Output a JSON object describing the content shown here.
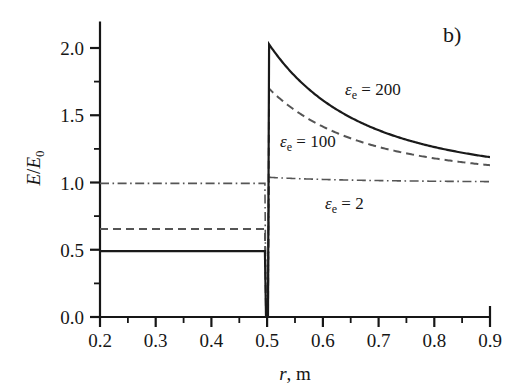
{
  "figure": {
    "panel_label": "b)",
    "background": "#ffffff",
    "ink_color": "#161616"
  },
  "axes": {
    "x": {
      "title_var": "r",
      "title_sep": ", ",
      "title_unit": "m",
      "min": 0.2,
      "max": 0.9,
      "major_ticks": [
        0.2,
        0.3,
        0.4,
        0.5,
        0.6,
        0.7,
        0.8,
        0.9
      ],
      "tick_labels": [
        "0.2",
        "0.3",
        "0.4",
        "0.5",
        "0.6",
        "0.7",
        "0.8",
        "0.9"
      ],
      "minor_ticks": [
        0.25,
        0.35,
        0.45,
        0.55,
        0.65,
        0.75,
        0.85
      ],
      "tick_direction": "out"
    },
    "y": {
      "title_num": "E",
      "title_slash": "/",
      "title_den": "E",
      "title_den_sub": "0",
      "min": 0.0,
      "max": 2.2,
      "major_ticks": [
        0.0,
        0.5,
        1.0,
        1.5,
        2.0
      ],
      "tick_labels": [
        "0.0",
        "0.5",
        "1.0",
        "1.5",
        "2.0"
      ],
      "minor_ticks": [
        0.25,
        0.75,
        1.25,
        1.75
      ],
      "tick_direction": "out"
    }
  },
  "chart_data": {
    "type": "line",
    "title": "",
    "subtitle": "",
    "xlabel": "r, m",
    "ylabel": "E/E0",
    "xlim": [
      0.2,
      0.9
    ],
    "ylim": [
      0.0,
      2.2
    ],
    "grid": false,
    "legend": "inline-annotations",
    "interface_radius": 0.5,
    "series": [
      {
        "name": "eps_e = 200",
        "label_eps": "ε",
        "label_sub": "e",
        "label_eq": " = ",
        "label_value": "200",
        "style": "solid",
        "color": "#1a1a1a",
        "width": 2.0,
        "inner_value": 0.49,
        "peak_value": 2.03,
        "end_value": 1.19,
        "x": [
          0.2,
          0.25,
          0.3,
          0.35,
          0.4,
          0.45,
          0.49,
          0.499,
          0.501,
          0.52,
          0.55,
          0.58,
          0.6,
          0.64,
          0.68,
          0.7,
          0.74,
          0.78,
          0.8,
          0.84,
          0.88,
          0.9
        ],
        "y": [
          0.49,
          0.49,
          0.49,
          0.49,
          0.49,
          0.49,
          0.49,
          0.49,
          2.03,
          1.905,
          1.745,
          1.61,
          1.532,
          1.4,
          1.3,
          1.258,
          1.19,
          1.142,
          1.122,
          1.09,
          1.064,
          1.19
        ]
      },
      {
        "name": "eps_e = 100",
        "label_eps": "ε",
        "label_sub": "e",
        "label_eq": " = ",
        "label_value": "100",
        "style": "dashed",
        "color": "#555555",
        "width": 2.0,
        "inner_value": 0.655,
        "peak_value": 1.7,
        "end_value": 1.13,
        "x": [
          0.2,
          0.25,
          0.3,
          0.35,
          0.4,
          0.45,
          0.49,
          0.499,
          0.501,
          0.52,
          0.55,
          0.58,
          0.6,
          0.64,
          0.68,
          0.7,
          0.74,
          0.78,
          0.8,
          0.84,
          0.88,
          0.9
        ],
        "y": [
          0.655,
          0.655,
          0.655,
          0.655,
          0.655,
          0.655,
          0.655,
          0.655,
          1.7,
          1.616,
          1.505,
          1.415,
          1.362,
          1.275,
          1.208,
          1.18,
          1.135,
          1.1,
          1.086,
          1.062,
          1.044,
          1.13
        ]
      },
      {
        "name": "eps_e = 2",
        "label_eps": "ε",
        "label_sub": "e",
        "label_eq": " = ",
        "label_value": "2",
        "style": "dash-dot",
        "color": "#555555",
        "width": 1.6,
        "inner_value": 0.995,
        "peak_value": 1.04,
        "end_value": 1.008,
        "x": [
          0.2,
          0.25,
          0.3,
          0.35,
          0.4,
          0.45,
          0.49,
          0.499,
          0.501,
          0.52,
          0.55,
          0.58,
          0.6,
          0.64,
          0.68,
          0.7,
          0.74,
          0.78,
          0.8,
          0.84,
          0.88,
          0.9
        ],
        "y": [
          0.995,
          0.995,
          0.995,
          0.995,
          0.995,
          0.995,
          0.995,
          0.995,
          1.04,
          1.036,
          1.03,
          1.025,
          1.022,
          1.018,
          1.015,
          1.014,
          1.012,
          1.01,
          1.009,
          1.008,
          1.008,
          1.008
        ]
      }
    ],
    "annotations": [
      {
        "text": "εe = 200",
        "x": 0.655,
        "y": 1.66
      },
      {
        "text": "εe = 100",
        "x": 0.545,
        "y": 1.28
      },
      {
        "text": "εe = 2",
        "x": 0.63,
        "y": 0.85
      },
      {
        "text": "b)",
        "x": 0.855,
        "y": 2.16
      }
    ]
  }
}
